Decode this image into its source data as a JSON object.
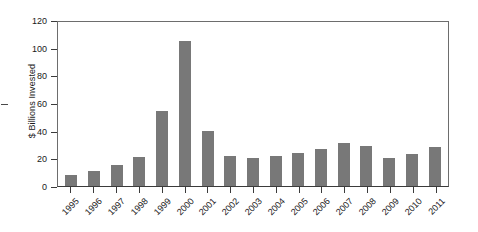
{
  "chart_data": {
    "type": "bar",
    "title": "",
    "subtitle": "",
    "xlabel": "",
    "ylabel": "$ Billions Invested",
    "ylim": [
      0,
      120
    ],
    "yticks": [
      0,
      20,
      40,
      60,
      80,
      100,
      120
    ],
    "grid": false,
    "legend": null,
    "bar_color": "#787878",
    "axis_color": "#3b3b3b",
    "categories": [
      "1995",
      "1996",
      "1997",
      "1998",
      "1999",
      "2000",
      "2001",
      "2002",
      "2003",
      "2004",
      "2005",
      "2006",
      "2007",
      "2008",
      "2009",
      "2010",
      "2011"
    ],
    "values": [
      8,
      11,
      15,
      21,
      54,
      105,
      40,
      22,
      20,
      22,
      24,
      27,
      31,
      29,
      20,
      23,
      28
    ],
    "xtick_labels": [
      "1995",
      "1996",
      "1997",
      "1998",
      "1999",
      "2000",
      "2001",
      "2002",
      "2003",
      "2004",
      "2005",
      "2006",
      "2007",
      "2008",
      "2009",
      "2010",
      "2011"
    ],
    "ytick_labels": [
      "0",
      "20",
      "40",
      "60",
      "80",
      "100",
      "120"
    ]
  }
}
